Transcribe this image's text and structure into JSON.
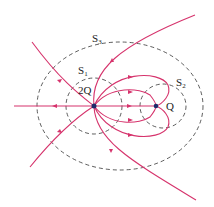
{
  "diagram": {
    "charges": [
      {
        "label": "2Q",
        "x": 94,
        "y": 106
      },
      {
        "label": "Q",
        "x": 156,
        "y": 106
      }
    ],
    "surfaces": [
      {
        "name": "S",
        "sub": "1",
        "encloses": "2Q"
      },
      {
        "name": "S",
        "sub": "2",
        "encloses": "Q"
      },
      {
        "name": "S",
        "sub": "3",
        "encloses": "2Q and Q"
      }
    ],
    "colors": {
      "field_line": "#d6336c",
      "surface": "#333333",
      "charge": "#1f2a6b"
    }
  }
}
